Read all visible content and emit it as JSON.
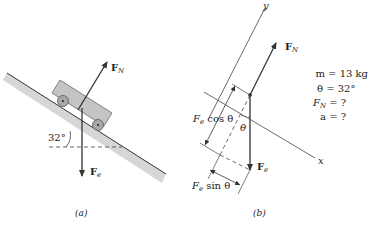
{
  "panel_a": {
    "caption": "(a)",
    "angle_label": "32°",
    "force_normal": {
      "main": "F",
      "sub": "N"
    },
    "force_weight": {
      "main": "F",
      "sub": "e"
    }
  },
  "panel_b": {
    "caption": "(b)",
    "axis_x": "x",
    "axis_y": "y",
    "theta": "θ",
    "force_normal": {
      "main": "F",
      "sub": "N"
    },
    "force_weight": {
      "main": "F",
      "sub": "e"
    },
    "component_cos": {
      "main": "F",
      "sub": "e",
      "rest": " cos θ"
    },
    "component_sin": {
      "main": "F",
      "sub": "e",
      "rest": " sin θ"
    }
  },
  "givens": {
    "mass": "m = 13 kg",
    "theta": "θ = 32°",
    "normal_force": {
      "main": "F",
      "sub": "N",
      "rest": " = ?"
    },
    "acceleration": "a = ?"
  },
  "colors": {
    "incline_fill": "#d4d4d4",
    "cart_fill": "#c8c8c8",
    "wheel_fill": "#a8a8a8",
    "line": "#333333"
  }
}
